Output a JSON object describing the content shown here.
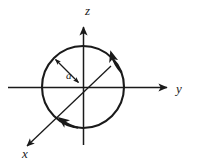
{
  "figure": {
    "kind": "coordinate-axes-diagram",
    "background_color": "#ffffff",
    "stroke_color": "#1a1a1a",
    "axes": [
      {
        "id": "z",
        "label": "z",
        "label_x": 85,
        "label_y": 15,
        "direction": "up",
        "has_arrowhead": true
      },
      {
        "id": "y",
        "label": "y",
        "label_x": 176,
        "label_y": 93,
        "direction": "right",
        "has_arrowhead": true
      },
      {
        "id": "x",
        "label": "x",
        "label_x": 22,
        "label_y": 158,
        "direction": "down-left",
        "has_arrowhead": true
      }
    ],
    "circle": {
      "center_x": 83,
      "center_y": 87,
      "radius": 41,
      "stroke_width": 2.1,
      "fill": "none",
      "direction": "counterclockwise",
      "direction_arrow_count": 2
    },
    "radius_indicator": {
      "label": "a",
      "label_x": 68,
      "label_y": 77,
      "from_x": 83,
      "from_y": 87,
      "to_x": 54,
      "to_y": 58,
      "double_headed": true
    }
  }
}
